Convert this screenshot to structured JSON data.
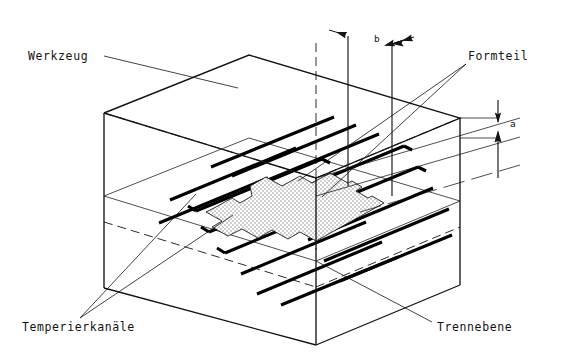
{
  "figure": {
    "type": "technical-isometric-drawing",
    "language": "de",
    "background_color": "#ffffff",
    "ink_color": "#141414",
    "part_fill_color": "#d9d9d9",
    "channel_color": "#000000"
  },
  "labels": {
    "tool": "Werkzeug",
    "part": "Formteil",
    "channels": "Temperierkanäle",
    "parting_plane": "Trennebene"
  },
  "dimensions": {
    "b": "b",
    "a": "a"
  },
  "callouts": [
    {
      "name": "tool",
      "text": "Werkzeug",
      "x": 28,
      "y": 60,
      "anchor": "start"
    },
    {
      "name": "part",
      "text": "Formteil",
      "x": 466,
      "y": 60,
      "anchor": "start"
    },
    {
      "name": "channels",
      "text": "Temperierkanäle",
      "x": 22,
      "y": 329,
      "anchor": "start"
    },
    {
      "name": "parting-plane",
      "text": "Trennebene",
      "x": 437,
      "y": 329,
      "anchor": "start"
    }
  ],
  "dimension_marks": [
    {
      "name": "b",
      "text": "b",
      "x": 374,
      "y": 42
    },
    {
      "name": "a",
      "text": "a",
      "x": 522,
      "y": 127
    }
  ],
  "geometry_note": {
    "mold_block": "rectangular isometric block, open wireframe with hidden dashed edges",
    "parting_plane": "horizontal plane bisecting the block",
    "cooling_channels": "16 thick parallel bores running diagonally in the parting plane",
    "molded_part": "stippled stepped parallelogram cavity centered on the parting plane"
  }
}
